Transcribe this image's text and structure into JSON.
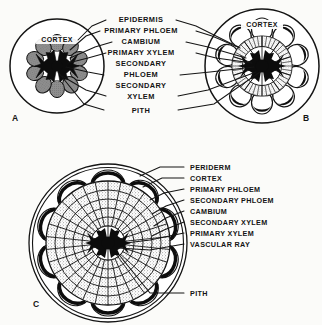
{
  "figure": {
    "background_color": "#fbfbf9",
    "ink_color": "#141414"
  },
  "panels": [
    {
      "id": "A",
      "letter": "A",
      "cortex_label": "CORTEX",
      "description": "herbaceous primary stem cross section"
    },
    {
      "id": "B",
      "letter": "B",
      "cortex_label": "CORTEX",
      "description": "stem with early secondary growth"
    },
    {
      "id": "C",
      "letter": "C",
      "cortex_label": "",
      "description": "woody stem with extensive secondary growth"
    }
  ],
  "top_labels": [
    {
      "text": "EPIDERMIS"
    },
    {
      "text": "PRIMARY  PHLOEM"
    },
    {
      "text": "CAMBIUM"
    },
    {
      "text": "PRIMARY  XYLEM"
    },
    {
      "text": "SECONDARY"
    },
    {
      "text": "PHLOEM"
    },
    {
      "text": "SECONDARY"
    },
    {
      "text": "XYLEM"
    },
    {
      "text": "PITH"
    }
  ],
  "bottom_labels": [
    {
      "text": "PERIDERM"
    },
    {
      "text": "CORTEX"
    },
    {
      "text": "PRIMARY  PHLOEM"
    },
    {
      "text": "SECONDARY  PHLOEM"
    },
    {
      "text": "CAMBIUM"
    },
    {
      "text": "SECONDARY  XYLEM"
    },
    {
      "text": "PRIMARY  XYLEM"
    },
    {
      "text": "VASCULAR RAY"
    },
    {
      "text": "PITH"
    }
  ]
}
